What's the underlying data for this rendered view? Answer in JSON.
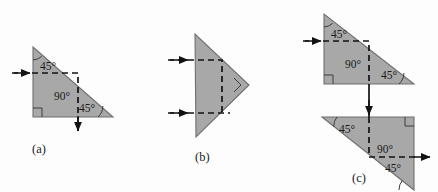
{
  "figure": {
    "caption_labels": [
      "(a)",
      "(b)",
      "(c)"
    ],
    "background_color": "#fdfdfd",
    "prism_fill": "#a8a8a8",
    "prism_stroke": "#6f6f6f",
    "ray_color": "#121212",
    "text_color": "#1b1b1b"
  },
  "panels": [
    {
      "id": "a",
      "label": "(a)",
      "label_pos": {
        "x": 32,
        "y": 153
      },
      "prisms": [
        {
          "name": "right-isosceles-prism",
          "points": "33,47 33,117 113,117",
          "angle_labels": [
            {
              "text": "45°",
              "x": 40,
              "y": 70
            },
            {
              "text": "90°",
              "x": 54,
              "y": 100
            },
            {
              "text": "45°",
              "x": 79,
              "y": 112
            }
          ],
          "angle_arcs": [
            {
              "cx": 33,
              "cy": 47,
              "r": 13,
              "start": 90,
              "end": 48
            },
            {
              "cx": 113,
              "cy": 117,
              "r": 15,
              "start": 180,
              "end": 222
            }
          ],
          "right_angle_marker": {
            "x": 33,
            "y": 117,
            "size": 9,
            "dx": 1,
            "dy": -1
          }
        }
      ],
      "rays": [
        {
          "name": "incident-ray-horizontal",
          "kind": "dashed-polyline",
          "points": "12,73 78,73 78,131",
          "arrows": [
            {
              "x": 28,
              "y": 73,
              "dir": "right"
            },
            {
              "x": 78,
              "y": 127,
              "dir": "down"
            }
          ]
        }
      ]
    },
    {
      "id": "b",
      "label": "(b)",
      "label_pos": {
        "x": 195,
        "y": 161
      },
      "prisms": [
        {
          "name": "right-pointing-prism",
          "points": "195,34 196,137 249,85",
          "angle_labels": [],
          "angle_arcs": [],
          "right_angle_marker": {
            "x": 249,
            "y": 85,
            "size": 10,
            "dx": -1,
            "dy": 0,
            "rotate": 45
          }
        }
      ],
      "rays": [
        {
          "name": "incident-ray-upper",
          "kind": "dashed-polyline",
          "points": "168,60 222,60 222,113",
          "arrows": [
            {
              "x": 186,
              "y": 60,
              "dir": "right"
            }
          ]
        },
        {
          "name": "incident-ray-lower",
          "kind": "dashed-polyline",
          "points": "168,113 228,113",
          "arrows": [
            {
              "x": 186,
              "y": 113,
              "dir": "right"
            }
          ]
        }
      ]
    },
    {
      "id": "c",
      "label": "(c)",
      "label_pos": {
        "x": 352,
        "y": 182
      },
      "prisms": [
        {
          "name": "upper-prism",
          "points": "324,14 324,84 414,84",
          "angle_labels": [
            {
              "text": "45°",
              "x": 331,
              "y": 38
            },
            {
              "text": "90°",
              "x": 345,
              "y": 68
            },
            {
              "text": "45°",
              "x": 381,
              "y": 79
            }
          ],
          "angle_arcs": [
            {
              "cx": 324,
              "cy": 14,
              "r": 13,
              "start": 90,
              "end": 48
            },
            {
              "cx": 414,
              "cy": 84,
              "r": 15,
              "start": 180,
              "end": 222
            }
          ],
          "right_angle_marker": {
            "x": 324,
            "y": 84,
            "size": 9,
            "dx": 1,
            "dy": -1
          }
        },
        {
          "name": "lower-prism",
          "points": "322,117 414,117 414,190",
          "angle_labels": [
            {
              "text": "45°",
              "x": 339,
              "y": 133
            },
            {
              "text": "90°",
              "x": 377,
              "y": 153
            },
            {
              "text": "45°",
              "x": 385,
              "y": 172
            }
          ],
          "angle_arcs": [
            {
              "cx": 322,
              "cy": 117,
              "r": 15,
              "start": 0,
              "end": 39
            },
            {
              "cx": 414,
              "cy": 190,
              "r": 15,
              "start": 180,
              "end": 141
            }
          ],
          "right_angle_marker": {
            "x": 414,
            "y": 117,
            "size": 9,
            "dx": -1,
            "dy": 1
          }
        }
      ],
      "rays": [
        {
          "name": "incident-ray-horizontal",
          "kind": "dashed-polyline",
          "points": "303,41 369,41 369,84",
          "arrows": [
            {
              "x": 319,
              "y": 41,
              "dir": "right"
            }
          ]
        },
        {
          "name": "transfer-ray-vertical",
          "kind": "solid-segment",
          "points": "369,84 369,117",
          "arrows": [
            {
              "x": 369,
              "y": 112,
              "dir": "down"
            }
          ]
        },
        {
          "name": "internal-ray-vertical",
          "kind": "dashed-polyline",
          "points": "369,117 369,157 425,157",
          "arrows": [
            {
              "x": 414,
              "y": 157,
              "dir": "right"
            }
          ]
        }
      ]
    }
  ]
}
